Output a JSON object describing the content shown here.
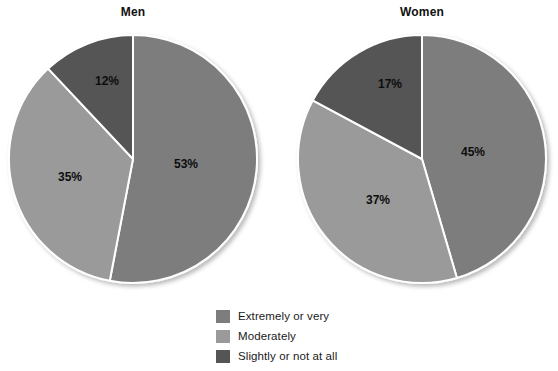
{
  "background_color": "#ffffff",
  "chart_data": {
    "type": "pie",
    "title": "",
    "legend_position": "bottom-center",
    "grid": false,
    "categories": [
      "Extremely or very",
      "Moderately",
      "Slightly or not at all"
    ],
    "colors": {
      "extremely_or_very": "#7d7d7d",
      "moderately": "#9a9a9a",
      "slightly_or_not_at_all": "#555555",
      "separator": "#ffffff",
      "label_text": "#0d0d0d",
      "title_text": "#111111"
    },
    "charts": [
      {
        "id": "men",
        "title": "Men",
        "center": {
          "x": 133,
          "y": 159
        },
        "radius": 124,
        "start_angle_deg": 0,
        "slices": [
          {
            "category": "Extremely or very",
            "value": 53,
            "label": "53%",
            "color": "#7d7d7d",
            "label_pos": {
              "x": 186,
              "y": 164
            }
          },
          {
            "category": "Moderately",
            "value": 35,
            "label": "35%",
            "color": "#9a9a9a",
            "label_pos": {
              "x": 70,
              "y": 177
            }
          },
          {
            "category": "Slightly or not at all",
            "value": 12,
            "label": "12%",
            "color": "#555555",
            "label_pos": {
              "x": 107,
              "y": 81
            }
          }
        ]
      },
      {
        "id": "women",
        "title": "Women",
        "center": {
          "x": 422,
          "y": 159
        },
        "radius": 124,
        "start_angle_deg": 0,
        "slices": [
          {
            "category": "Extremely or very",
            "value": 45,
            "label": "45%",
            "color": "#7d7d7d",
            "label_pos": {
              "x": 473,
              "y": 152
            }
          },
          {
            "category": "Moderately",
            "value": 37,
            "label": "37%",
            "color": "#9a9a9a",
            "label_pos": {
              "x": 378,
              "y": 200
            }
          },
          {
            "category": "Slightly or not at all",
            "value": 17,
            "label": "17%",
            "color": "#555555",
            "label_pos": {
              "x": 390,
              "y": 84
            }
          }
        ]
      }
    ],
    "legend": [
      {
        "label": "Extremely or very",
        "color": "#7d7d7d"
      },
      {
        "label": "Moderately",
        "color": "#9a9a9a"
      },
      {
        "label": "Slightly or not at all",
        "color": "#555555"
      }
    ]
  }
}
